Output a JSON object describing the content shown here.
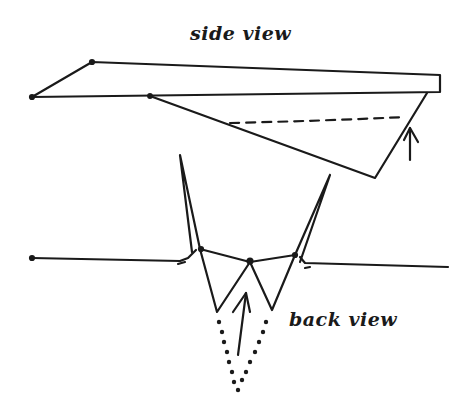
{
  "diagram": {
    "labels": {
      "side_view": "side view",
      "back_view": "back view"
    },
    "colors": {
      "ink": "#1a1a1a",
      "background": "#ffffff"
    },
    "side_view": {
      "wing_outline": [
        [
          32,
          97
        ],
        [
          92,
          62
        ],
        [
          440,
          75
        ],
        [
          440,
          92
        ],
        [
          32,
          97
        ]
      ],
      "keel_outline": [
        [
          150,
          96
        ],
        [
          375,
          178
        ],
        [
          427,
          93
        ]
      ],
      "dashed_fold_line": [
        [
          230,
          123
        ],
        [
          405,
          117
        ]
      ],
      "arrow": {
        "from": [
          410,
          160
        ],
        "to": [
          410,
          128
        ],
        "direction": "up"
      }
    },
    "back_view": {
      "left_wing": [
        [
          32,
          258
        ],
        [
          185,
          262
        ]
      ],
      "right_wing": [
        [
          302,
          265
        ],
        [
          448,
          267
        ]
      ],
      "left_winglet": [
        [
          180,
          155
        ],
        [
          200,
          249
        ]
      ],
      "right_winglet": [
        [
          330,
          175
        ],
        [
          295,
          255
        ]
      ],
      "body_top": [
        [
          200,
          249
        ],
        [
          250,
          262
        ],
        [
          295,
          255
        ]
      ],
      "body_folds": [
        [
          200,
          249
        ],
        [
          217,
          312
        ],
        [
          250,
          262
        ],
        [
          272,
          310
        ],
        [
          295,
          255
        ]
      ],
      "arrow": {
        "from": [
          238,
          355
        ],
        "to": [
          246,
          293
        ],
        "direction": "up"
      },
      "dotted_keel": [
        [
          219,
          322
        ],
        [
          238,
          390
        ],
        [
          266,
          322
        ]
      ]
    }
  }
}
